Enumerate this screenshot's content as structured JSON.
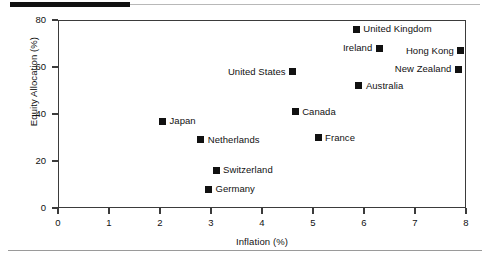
{
  "chart_data": {
    "type": "scatter",
    "title": "",
    "xlabel": "Inflation (%)",
    "ylabel": "Equity Allocation (%)",
    "xlim": [
      0,
      8
    ],
    "ylim": [
      0,
      80
    ],
    "xticks": [
      "0",
      "1",
      "2",
      "3",
      "4",
      "5",
      "6",
      "7",
      "8"
    ],
    "yticks": [
      "0",
      "20",
      "40",
      "60",
      "80"
    ],
    "grid": false,
    "legend": "none",
    "marker_color": "#111111",
    "points": [
      {
        "name": "United Kingdom",
        "x": 5.85,
        "y": 76,
        "label_side": "right"
      },
      {
        "name": "Ireland",
        "x": 6.3,
        "y": 68,
        "label_side": "left"
      },
      {
        "name": "Hong Kong",
        "x": 7.9,
        "y": 67,
        "label_side": "left"
      },
      {
        "name": "New Zealand",
        "x": 7.85,
        "y": 59,
        "label_side": "left"
      },
      {
        "name": "United States",
        "x": 4.6,
        "y": 58,
        "label_side": "left"
      },
      {
        "name": "Australia",
        "x": 5.9,
        "y": 52,
        "label_side": "right"
      },
      {
        "name": "Canada",
        "x": 4.65,
        "y": 41,
        "label_side": "right"
      },
      {
        "name": "Japan",
        "x": 2.05,
        "y": 37,
        "label_side": "right"
      },
      {
        "name": "Netherlands",
        "x": 2.8,
        "y": 29,
        "label_side": "right"
      },
      {
        "name": "France",
        "x": 5.1,
        "y": 30,
        "label_side": "right"
      },
      {
        "name": "Switzerland",
        "x": 3.1,
        "y": 16,
        "label_side": "right"
      },
      {
        "name": "Germany",
        "x": 2.95,
        "y": 8,
        "label_side": "right"
      }
    ]
  }
}
